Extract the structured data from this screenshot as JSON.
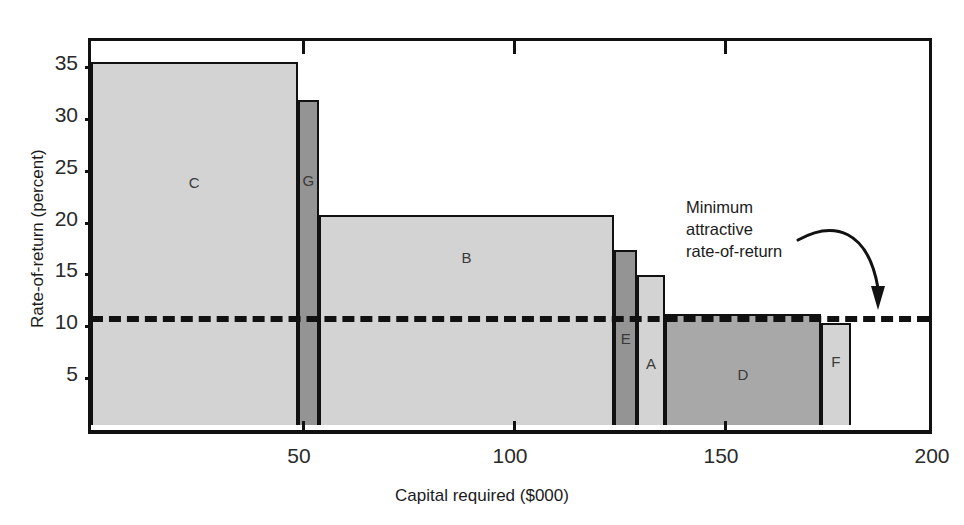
{
  "chart_data": {
    "type": "bar",
    "title": "",
    "xlabel": "Capital required ($000)",
    "ylabel": "Rate-of-return (percent)",
    "xlim": [
      0,
      200
    ],
    "ylim": [
      0,
      37
    ],
    "xticks": [
      "50",
      "100",
      "150",
      "200"
    ],
    "xtick_values": [
      50,
      100,
      150,
      200
    ],
    "yticks": [
      "5",
      "10",
      "15",
      "20",
      "25",
      "30",
      "35"
    ],
    "ytick_values": [
      5,
      10,
      15,
      20,
      25,
      30,
      35
    ],
    "grid": false,
    "legend": "none",
    "bars": [
      {
        "label": "C",
        "rate_of_return": 35.0,
        "capital_start": 0,
        "capital_end": 49,
        "capital_width": 49,
        "shade": "light"
      },
      {
        "label": "G",
        "rate_of_return": 31.3,
        "capital_start": 49,
        "capital_end": 54,
        "capital_width": 5,
        "shade": "dark"
      },
      {
        "label": "B",
        "rate_of_return": 20.2,
        "capital_start": 54,
        "capital_end": 124,
        "capital_width": 70,
        "shade": "light"
      },
      {
        "label": "E",
        "rate_of_return": 16.9,
        "capital_start": 124,
        "capital_end": 129.5,
        "capital_width": 5.5,
        "shade": "dark"
      },
      {
        "label": "A",
        "rate_of_return": 14.5,
        "capital_start": 129.5,
        "capital_end": 136,
        "capital_width": 6.5,
        "shade": "light"
      },
      {
        "label": "D",
        "rate_of_return": 10.7,
        "capital_start": 136,
        "capital_end": 173,
        "capital_width": 37,
        "shade": "medium"
      },
      {
        "label": "F",
        "rate_of_return": 9.8,
        "capital_start": 173,
        "capital_end": 180,
        "capital_width": 7,
        "shade": "light"
      }
    ],
    "annotations": [
      {
        "name": "minimum-attractive-rate-of-return",
        "text": "Minimum\nattractive\nrate-of-return",
        "value": 11.2,
        "kind": "threshold-line",
        "style": "dashed"
      }
    ]
  },
  "colors": {
    "light": "#d3d3d3",
    "medium": "#a8a8a8",
    "dark": "#949494",
    "axis": "#111111",
    "text": "#1b1b1b"
  }
}
